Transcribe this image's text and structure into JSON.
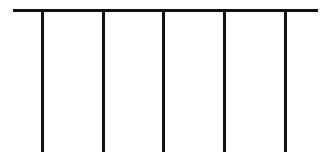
{
  "diagram": {
    "type": "comb",
    "stroke_color": "#111111",
    "background": "#ffffff",
    "top_bar": {
      "x1": 13,
      "x2": 318,
      "y": 9,
      "thickness": 3
    },
    "legs": [
      {
        "x": 41,
        "y_top": 9,
        "y_bottom": 152,
        "thickness": 3
      },
      {
        "x": 102,
        "y_top": 9,
        "y_bottom": 152,
        "thickness": 3
      },
      {
        "x": 162,
        "y_top": 9,
        "y_bottom": 152,
        "thickness": 3
      },
      {
        "x": 223,
        "y_top": 9,
        "y_bottom": 152,
        "thickness": 3
      },
      {
        "x": 284,
        "y_top": 9,
        "y_bottom": 152,
        "thickness": 3
      }
    ]
  }
}
